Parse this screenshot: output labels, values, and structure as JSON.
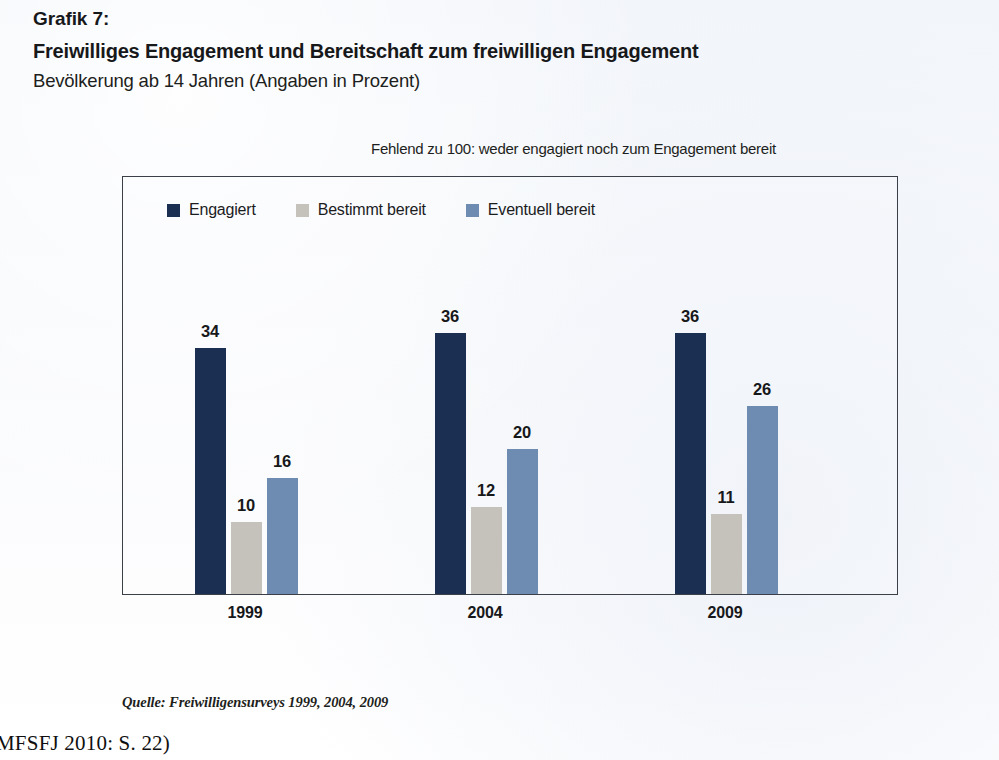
{
  "heading": {
    "figure_number": "Grafik 7:",
    "title": "Freiwilliges Engagement und Bereitschaft zum freiwilligen Engagement",
    "subtitle": "Bevölkerung ab 14 Jahren (Angaben in Prozent)"
  },
  "note": "Fehlend zu 100: weder engagiert noch zum Engagement bereit",
  "source": "Quelle: Freiwilligensurveys 1999, 2004, 2009",
  "citation": "MFSFJ 2010: S. 22)",
  "colors": {
    "engagiert": "#1b2f52",
    "bestimmt_bereit": "#c5c1bb",
    "eventuell_bereit": "#6e8cb2",
    "frame": "#3b4048",
    "page_background": "#f4f6fa",
    "text": "#17181a"
  },
  "chart_data": {
    "type": "bar",
    "title": "Freiwilliges Engagement und Bereitschaft zum freiwilligen Engagement",
    "subtitle": "Bevölkerung ab 14 Jahren (Angaben in Prozent)",
    "note": "Fehlend zu 100: weder engagiert noch zum Engagement bereit",
    "xlabel": "",
    "ylabel": "Prozent",
    "ylim": [
      0,
      45
    ],
    "grid": false,
    "legend_position": "top-left inside frame",
    "categories": [
      "1999",
      "2004",
      "2009"
    ],
    "series": [
      {
        "name": "Engagiert",
        "color": "#1b2f52",
        "values": [
          34,
          36,
          36
        ]
      },
      {
        "name": "Bestimmt bereit",
        "color": "#c5c1bb",
        "values": [
          10,
          12,
          11
        ]
      },
      {
        "name": "Eventuell bereit",
        "color": "#6e8cb2",
        "values": [
          16,
          20,
          26
        ]
      }
    ],
    "source": "Quelle: Freiwilligensurveys 1999, 2004, 2009"
  },
  "layout": {
    "bar_width_px": 31,
    "group_centers_px": [
      245,
      485,
      725
    ],
    "plot_height_px": 417,
    "value_scale_px_per_unit": 7.25
  }
}
